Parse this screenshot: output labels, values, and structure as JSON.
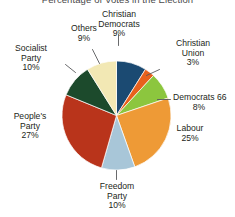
{
  "chart_data": {
    "type": "pie",
    "title": "Percentage of Votes in the Election",
    "xlabel": "",
    "ylabel": "",
    "legend_position": "none",
    "grid": false,
    "value_suffix": "%",
    "start_angle_deg": 0,
    "direction": "clockwise",
    "categories": [
      "Christian Democrats",
      "Christian Union",
      "Democrats 66",
      "Labour",
      "Freedom Party",
      "People's Party",
      "Socialist Party",
      "Others"
    ],
    "values": [
      9,
      3,
      8,
      25,
      10,
      27,
      10,
      9
    ],
    "colors": [
      "#1b4a72",
      "#e8611c",
      "#8cc63e",
      "#ee9a36",
      "#a8c6d8",
      "#b9341b",
      "#1c4a2c",
      "#f2e8b4"
    ],
    "slices": [
      {
        "label": "Christian Democrats",
        "value": 9,
        "value_text": "9%",
        "color": "#1b4a72"
      },
      {
        "label": "Christian Union",
        "value": 3,
        "value_text": "3%",
        "color": "#e8611c"
      },
      {
        "label": "Democrats 66",
        "value": 8,
        "value_text": "8%",
        "color": "#8cc63e"
      },
      {
        "label": "Labour",
        "value": 25,
        "value_text": "25%",
        "color": "#ee9a36"
      },
      {
        "label": "Freedom Party",
        "value": 10,
        "value_text": "10%",
        "color": "#a8c6d8"
      },
      {
        "label": "People's Party",
        "value": 27,
        "value_text": "27%",
        "color": "#b9341b"
      },
      {
        "label": "Socialist Party",
        "value": 10,
        "value_text": "10%",
        "color": "#1c4a2c"
      },
      {
        "label": "Others",
        "value": 9,
        "value_text": "9%",
        "color": "#f2e8b4"
      }
    ]
  },
  "labels": {
    "christian_democrats": {
      "line1": "Christian",
      "line2": "Democrats",
      "pct": "9%"
    },
    "christian_union": {
      "line1": "Christian",
      "line2": "Union",
      "pct": "3%"
    },
    "democrats_66": {
      "line1": "Democrats 66",
      "pct": "8%"
    },
    "labour": {
      "line1": "Labour",
      "pct": "25%"
    },
    "freedom_party": {
      "line1": "Freedom",
      "line2": "Party",
      "pct": "10%"
    },
    "peoples_party": {
      "line1": "People's",
      "line2": "Party",
      "pct": "27%"
    },
    "socialist_party": {
      "line1": "Socialist",
      "line2": "Party",
      "pct": "10%"
    },
    "others": {
      "line1": "Others",
      "pct": "9%"
    }
  },
  "style": {
    "background": "#ffffff",
    "title_color": "#4a4a4a",
    "label_color": "#231f20",
    "leader_color": "#58595b"
  }
}
